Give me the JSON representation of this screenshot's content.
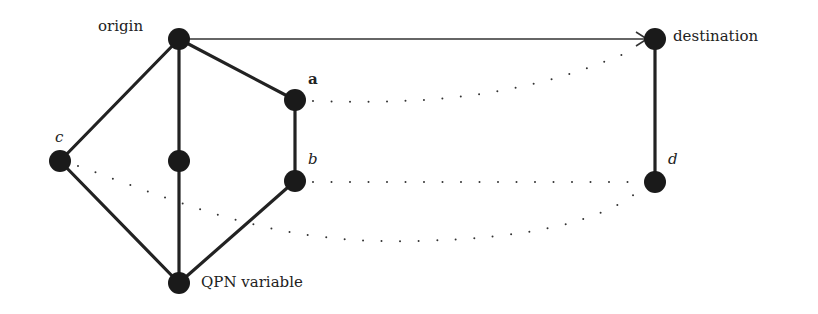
{
  "diagram": {
    "type": "graph",
    "nodes": [
      {
        "id": "origin",
        "label": "origin",
        "x": 179,
        "y": 39
      },
      {
        "id": "a",
        "label": "a",
        "x": 295,
        "y": 100
      },
      {
        "id": "b",
        "label": "b",
        "x": 295,
        "y": 181
      },
      {
        "id": "c",
        "label": "c",
        "x": 60,
        "y": 161
      },
      {
        "id": "mid",
        "label": "",
        "x": 179,
        "y": 161
      },
      {
        "id": "qpn",
        "label": "QPN variable",
        "x": 179,
        "y": 283
      },
      {
        "id": "destination",
        "label": "destination",
        "x": 655,
        "y": 39
      },
      {
        "id": "d",
        "label": "d",
        "x": 655,
        "y": 182
      }
    ],
    "edges": [
      {
        "from": "origin",
        "to": "destination",
        "style": "arrow"
      },
      {
        "from": "origin",
        "to": "a",
        "style": "solid"
      },
      {
        "from": "origin",
        "to": "c",
        "style": "solid"
      },
      {
        "from": "origin",
        "to": "mid",
        "style": "solid"
      },
      {
        "from": "mid",
        "to": "qpn",
        "style": "solid"
      },
      {
        "from": "a",
        "to": "b",
        "style": "solid"
      },
      {
        "from": "b",
        "to": "qpn",
        "style": "solid"
      },
      {
        "from": "c",
        "to": "qpn",
        "style": "solid"
      },
      {
        "from": "destination",
        "to": "d",
        "style": "solid"
      },
      {
        "from": "a",
        "to": "destination",
        "style": "dotted"
      },
      {
        "from": "b",
        "to": "d",
        "style": "dotted"
      },
      {
        "from": "c",
        "to": "d",
        "style": "dotted"
      }
    ],
    "labels": {
      "origin": "origin",
      "a": "a",
      "b": "b",
      "c": "c",
      "qpn": "QPN variable",
      "destination": "destination",
      "d": "d"
    },
    "colors": {
      "node": "#1a1a1a",
      "edge": "#222222",
      "dots": "#333333"
    }
  }
}
